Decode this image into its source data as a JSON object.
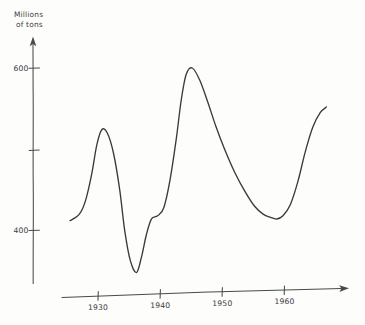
{
  "chart_data": {
    "type": "line",
    "title": "",
    "subtitle": "",
    "xlabel": "",
    "ylabel": "Millions of tons",
    "ylabel_line1": "Millions",
    "ylabel_line2": "of tons",
    "grid": false,
    "legend": "none",
    "style": "hand-drawn pencil sketch on paper",
    "xlim": [
      1925,
      1968
    ],
    "ylim": [
      330,
      640
    ],
    "x_ticks": [
      1930,
      1940,
      1950,
      1960
    ],
    "x_tick_labels": [
      "1930",
      "1940",
      "1950",
      "1960"
    ],
    "y_ticks": [
      400,
      500,
      600
    ],
    "y_tick_labels": [
      "400",
      "",
      "600"
    ],
    "y_labeled_ticks": [
      "600",
      "400"
    ],
    "series": [
      {
        "name": "Millions of tons",
        "x": [
          1925.5,
          1927.0,
          1928.0,
          1929.0,
          1929.8,
          1930.6,
          1931.5,
          1932.5,
          1933.5,
          1934.3,
          1935.2,
          1936.2,
          1937.0,
          1937.8,
          1938.6,
          1939.6,
          1940.6,
          1941.6,
          1942.6,
          1943.4,
          1944.2,
          1945.2,
          1946.4,
          1947.6,
          1949.0,
          1950.4,
          1952.0,
          1953.6,
          1955.2,
          1956.6,
          1957.8,
          1958.8,
          1959.8,
          1961.0,
          1962.2,
          1963.4,
          1964.6,
          1965.8,
          1966.8
        ],
        "y": [
          412,
          420,
          437,
          470,
          505,
          524,
          520,
          495,
          450,
          400,
          363,
          348,
          367,
          395,
          414,
          418,
          428,
          462,
          512,
          560,
          592,
          600,
          585,
          560,
          528,
          500,
          472,
          449,
          430,
          420,
          416,
          414,
          418,
          432,
          460,
          497,
          527,
          545,
          552
        ]
      }
    ],
    "annotations": [
      {
        "text": "600",
        "kind": "y-tick-label",
        "value": 600
      },
      {
        "text": "400",
        "kind": "y-tick-label",
        "value": 400
      },
      {
        "text": "1930",
        "kind": "x-tick-label",
        "value": 1930
      },
      {
        "text": "1940",
        "kind": "x-tick-label",
        "value": 1940
      },
      {
        "text": "1950",
        "kind": "x-tick-label",
        "value": 1950
      },
      {
        "text": "1960",
        "kind": "x-tick-label",
        "value": 1960
      }
    ],
    "features": {
      "first_peak": {
        "x": 1945.2,
        "y": 600,
        "label": "peak near 600"
      },
      "second_peak": {
        "x": 1930.6,
        "y": 524,
        "label": "peak near 525"
      },
      "first_trough": {
        "x": 1936.2,
        "y": 348,
        "label": "trough near 348"
      },
      "second_trough": {
        "x": 1958.8,
        "y": 414,
        "label": "trough near 414"
      }
    },
    "colors": {
      "ink": "#3a3a3a",
      "axis": "#4a4a4a",
      "paper": "#fdfdfc"
    }
  },
  "axes": {
    "y_axis_label_line1": "Millions",
    "y_axis_label_line2": "of tons",
    "y_tick_600": "600",
    "y_tick_400": "400",
    "x_tick_1930": "1930",
    "x_tick_1940": "1940",
    "x_tick_1950": "1950",
    "x_tick_1960": "1960"
  }
}
